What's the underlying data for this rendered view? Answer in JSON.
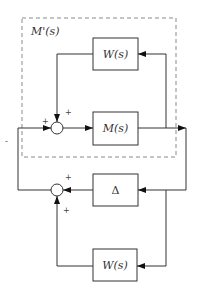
{
  "diagram": {
    "group": {
      "label": "M'(s)"
    },
    "blocks": {
      "w_top": {
        "label": "W(s)"
      },
      "m": {
        "label": "M(s)"
      },
      "delta": {
        "label": "Δ"
      },
      "w_bottom": {
        "label": "W(s)"
      }
    },
    "junctions": {
      "sum1": {
        "left_sign": "+",
        "top_sign": "+"
      },
      "sum2": {
        "top_sign": "+",
        "bottom_sign": "+"
      }
    },
    "stray_mark": "-"
  }
}
